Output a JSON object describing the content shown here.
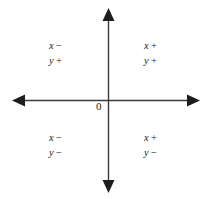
{
  "figure": {
    "type": "coordinate-plane-quadrant-signs",
    "background_color": "#ffffff",
    "axis_color": "#3a3a3a",
    "text_color": "#1d1d1d",
    "origin_label": "0"
  },
  "axes": {
    "horizontal": {
      "name": "x-axis",
      "y": 100,
      "x_start": 18,
      "x_end": 196,
      "arrow_start": true,
      "arrow_end": true
    },
    "vertical": {
      "name": "y-axis",
      "x": 108,
      "y_start": 13,
      "y_end": 188,
      "arrow_start": true,
      "arrow_end": true
    }
  },
  "quadrants": [
    {
      "id": "quadrant-1",
      "position": "top-right",
      "x_var": "x",
      "x_sign": "+",
      "y_var": "y",
      "y_sign": "+"
    },
    {
      "id": "quadrant-2",
      "position": "top-left",
      "x_var": "x",
      "x_sign": "−",
      "y_var": "y",
      "y_sign": "+"
    },
    {
      "id": "quadrant-3",
      "position": "bottom-left",
      "x_var": "x",
      "x_sign": "−",
      "y_var": "y",
      "y_sign": "−"
    },
    {
      "id": "quadrant-4",
      "position": "bottom-right",
      "x_var": "x",
      "x_sign": "+",
      "y_var": "y",
      "y_sign": "−"
    }
  ]
}
